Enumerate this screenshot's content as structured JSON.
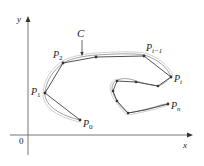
{
  "figure": {
    "axes": {
      "x_label": "x",
      "y_label": "y",
      "origin_label": "0"
    },
    "curve_label": "C",
    "points": [
      {
        "name": "P",
        "sub": "0",
        "x": 80,
        "y": 120
      },
      {
        "name": "P",
        "sub": "1",
        "x": 45,
        "y": 93
      },
      {
        "name": "P",
        "sub": "2",
        "x": 63,
        "y": 63
      },
      {
        "name": "",
        "sub": "",
        "x": 96,
        "y": 57
      },
      {
        "name": "P",
        "sub": "i−1",
        "x": 144,
        "y": 56
      },
      {
        "name": "P",
        "sub": "i",
        "x": 171,
        "y": 77
      },
      {
        "name": "",
        "sub": "",
        "x": 158,
        "y": 86
      },
      {
        "name": "",
        "sub": "",
        "x": 136,
        "y": 82
      },
      {
        "name": "",
        "sub": "",
        "x": 117,
        "y": 81
      },
      {
        "name": "",
        "sub": "",
        "x": 113,
        "y": 91
      },
      {
        "name": "",
        "sub": "",
        "x": 117,
        "y": 101
      },
      {
        "name": "",
        "sub": "",
        "x": 128,
        "y": 113
      },
      {
        "name": "P",
        "sub": "n",
        "x": 168,
        "y": 104
      }
    ],
    "labels": {
      "p0": {
        "main": "P",
        "sub": "0"
      },
      "p1": {
        "main": "P",
        "sub": "1"
      },
      "p2": {
        "main": "P",
        "sub": "2"
      },
      "pim1": {
        "main": "P",
        "sub": "i−1"
      },
      "pi": {
        "main": "P",
        "sub": "i"
      },
      "pn": {
        "main": "P",
        "sub": "n"
      }
    },
    "colors": {
      "curve": "#777777",
      "polygon": "#444444",
      "axis": "#555555"
    }
  }
}
